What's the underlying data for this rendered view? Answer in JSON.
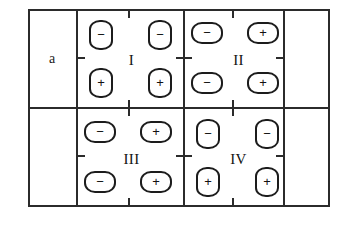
{
  "figure": {
    "label": "a",
    "caption_label": "a",
    "stroke_color": "#2b2b2b",
    "symbol_color": "#1c1c1c",
    "background": "#ffffff"
  },
  "grid": {
    "columns": 4,
    "rows": 2,
    "column_names": [
      "label-column",
      "quadrant-column-left",
      "quadrant-column-right",
      "empty-column"
    ],
    "row_names": [
      "top-row",
      "bottom-row"
    ]
  },
  "quadrants": [
    {
      "id": "quadrant-1",
      "numeral": "I",
      "orientation": "vertical",
      "position": "top-left",
      "symbols": [
        {
          "slot": "top-left",
          "sign": "−",
          "shape": "capsule-vertical"
        },
        {
          "slot": "top-right",
          "sign": "−",
          "shape": "capsule-vertical"
        },
        {
          "slot": "bottom-left",
          "sign": "+",
          "shape": "capsule-vertical"
        },
        {
          "slot": "bottom-right",
          "sign": "+",
          "shape": "capsule-vertical"
        }
      ]
    },
    {
      "id": "quadrant-2",
      "numeral": "II",
      "orientation": "horizontal",
      "position": "top-right",
      "symbols": [
        {
          "slot": "top-left",
          "sign": "−",
          "shape": "capsule-horizontal"
        },
        {
          "slot": "top-right",
          "sign": "+",
          "shape": "capsule-horizontal"
        },
        {
          "slot": "bottom-left",
          "sign": "−",
          "shape": "capsule-horizontal"
        },
        {
          "slot": "bottom-right",
          "sign": "+",
          "shape": "capsule-horizontal"
        }
      ]
    },
    {
      "id": "quadrant-3",
      "numeral": "III",
      "orientation": "horizontal",
      "position": "bottom-left",
      "symbols": [
        {
          "slot": "top-left",
          "sign": "−",
          "shape": "capsule-horizontal"
        },
        {
          "slot": "top-right",
          "sign": "+",
          "shape": "capsule-horizontal"
        },
        {
          "slot": "bottom-left",
          "sign": "−",
          "shape": "capsule-horizontal"
        },
        {
          "slot": "bottom-right",
          "sign": "+",
          "shape": "capsule-horizontal"
        }
      ]
    },
    {
      "id": "quadrant-4",
      "numeral": "IV",
      "orientation": "vertical",
      "position": "bottom-right",
      "symbols": [
        {
          "slot": "top-left",
          "sign": "−",
          "shape": "capsule-vertical"
        },
        {
          "slot": "top-right",
          "sign": "−",
          "shape": "capsule-vertical"
        },
        {
          "slot": "bottom-left",
          "sign": "+",
          "shape": "capsule-vertical"
        },
        {
          "slot": "bottom-right",
          "sign": "+",
          "shape": "capsule-vertical"
        }
      ]
    }
  ]
}
